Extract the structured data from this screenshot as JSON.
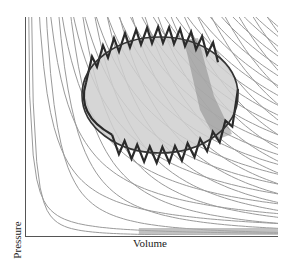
{
  "figure": {
    "xlabel": "Volume",
    "ylabel": "Pressure",
    "colors": {
      "axis": "#555555",
      "isotherm": "#9a9a9a",
      "adiabat": "#9a9a9a",
      "cycle_fill": "#cfcfcf",
      "cycle_stroke": "#333333",
      "zigzag_stroke": "#2a2a2a",
      "strip_fill": "#8c8c8c"
    },
    "plot_area": {
      "x0": 25,
      "y0": 17,
      "x1": 278,
      "y1": 236
    },
    "isotherm_count": 22,
    "adiabat_count": 22,
    "ellipse": {
      "cx": 160,
      "cy": 95,
      "rx": 78,
      "ry": 58,
      "rotate": 0
    },
    "zigzag_top_count": 12,
    "zigzag_bottom_count": 10
  },
  "chart_data": {
    "type": "line",
    "title": "",
    "xlabel": "Volume",
    "ylabel": "Pressure",
    "grid": false,
    "legend": "none",
    "series": [
      {
        "name": "isotherms",
        "description": "family of hyperbolae P·V = const (light gray)"
      },
      {
        "name": "adiabats",
        "description": "family of steeper curves P·V^γ = const (light gray)"
      },
      {
        "name": "cycle",
        "description": "elliptical closed cycle (dark outline, gray fill)"
      },
      {
        "name": "approximating cycle",
        "description": "zigzag of alternating isotherm/adiabat segments tracing the ellipse (dark)"
      }
    ]
  }
}
